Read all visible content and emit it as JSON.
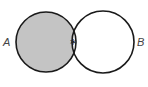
{
  "diagram": {
    "type": "venn",
    "sets": [
      {
        "label": "A",
        "cx": 46,
        "cy": 42,
        "r": 30,
        "shaded_region": "A only"
      },
      {
        "label": "B",
        "cx": 103,
        "cy": 42,
        "r": 31
      }
    ],
    "intersection_marker": "*",
    "colors": {
      "shade": "#c4c4c4",
      "stroke": "#1a1a1a",
      "background": "#ffffff"
    }
  }
}
